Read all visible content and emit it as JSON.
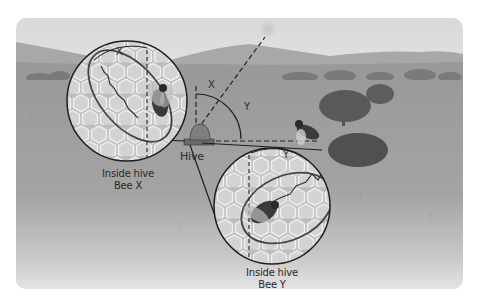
{
  "figure": {
    "background_colors": {
      "sky": "#e6e6e6",
      "hills": "#a9a9a9",
      "grass": "#9d9d9d",
      "ground_fade": "#dcdcdc",
      "comb": "#cfcfcf",
      "outline": "#1e1e1e"
    }
  },
  "labels": {
    "hive": "Hive",
    "bee_x_line1": "Inside hive",
    "bee_x_line2": "Bee X",
    "bee_y_line1": "Inside hive",
    "bee_y_line2": "Bee Y",
    "angle_x": "X",
    "angle_y": "Y",
    "inset_x_angle": "X",
    "inset_y_angle": "Y"
  },
  "elements": {
    "sun": {
      "name": "sun"
    },
    "hive": {
      "name": "hive"
    },
    "food_sources": [
      "tree",
      "shrub"
    ],
    "insets": [
      {
        "name": "inset-bee-x",
        "angle_label": "X"
      },
      {
        "name": "inset-bee-y",
        "angle_label": "Y"
      }
    ]
  }
}
